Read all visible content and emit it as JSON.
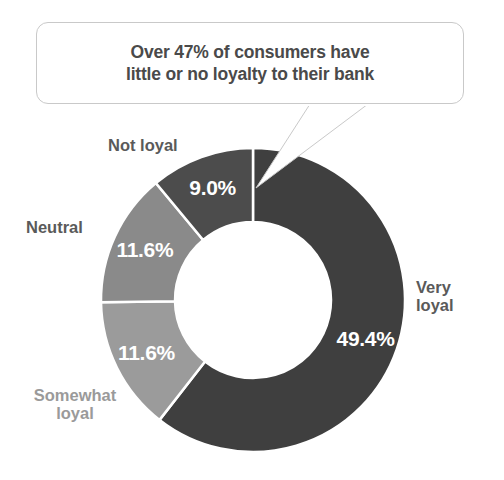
{
  "callout": {
    "text": "Over 47% of consumers have\nlittle or no loyalty to their bank"
  },
  "chart_data": {
    "type": "pie",
    "variant": "donut",
    "title": "",
    "subtitle": "",
    "xlabel": "",
    "ylabel": "",
    "legend_position": "outside-labels",
    "grid": false,
    "value_suffix": "%",
    "start_angle_deg": 0,
    "direction": "clockwise",
    "categories": [
      "Very loyal",
      "Somewhat loyal",
      "Neutral",
      "Not loyal"
    ],
    "values": [
      49.4,
      11.6,
      11.6,
      9.0
    ],
    "value_labels": [
      "49.4%",
      "11.6%",
      "11.6%",
      "9.0%"
    ],
    "colors": [
      "#3f3f3f",
      "#9b9b9b",
      "#8a8a8a",
      "#4c4c4c"
    ],
    "series": [
      {
        "name": "Consumer bank loyalty",
        "values": [
          49.4,
          11.6,
          11.6,
          9.0
        ]
      }
    ],
    "slices": [
      {
        "label": "Very loyal",
        "value": 49.4,
        "value_label": "49.4%",
        "color": "#3f3f3f",
        "label_color": "#5a5a5a",
        "label_text": "Very\nloyal"
      },
      {
        "label": "Somewhat loyal",
        "value": 11.6,
        "value_label": "11.6%",
        "color": "#9b9b9b",
        "label_color": "#9a9a9a",
        "label_text": "Somewhat\nloyal"
      },
      {
        "label": "Neutral",
        "value": 11.6,
        "value_label": "11.6%",
        "color": "#8a8a8a",
        "label_color": "#5a5a5a",
        "label_text": "Neutral"
      },
      {
        "label": "Not loyal",
        "value": 9.0,
        "value_label": "9.0%",
        "color": "#4c4c4c",
        "label_color": "#5a5a5a",
        "label_text": "Not loyal"
      }
    ],
    "annotations": [
      {
        "name": "callout",
        "text": "Over 47% of consumers have little or no loyalty to their bank",
        "points_to": "top of donut"
      }
    ]
  }
}
